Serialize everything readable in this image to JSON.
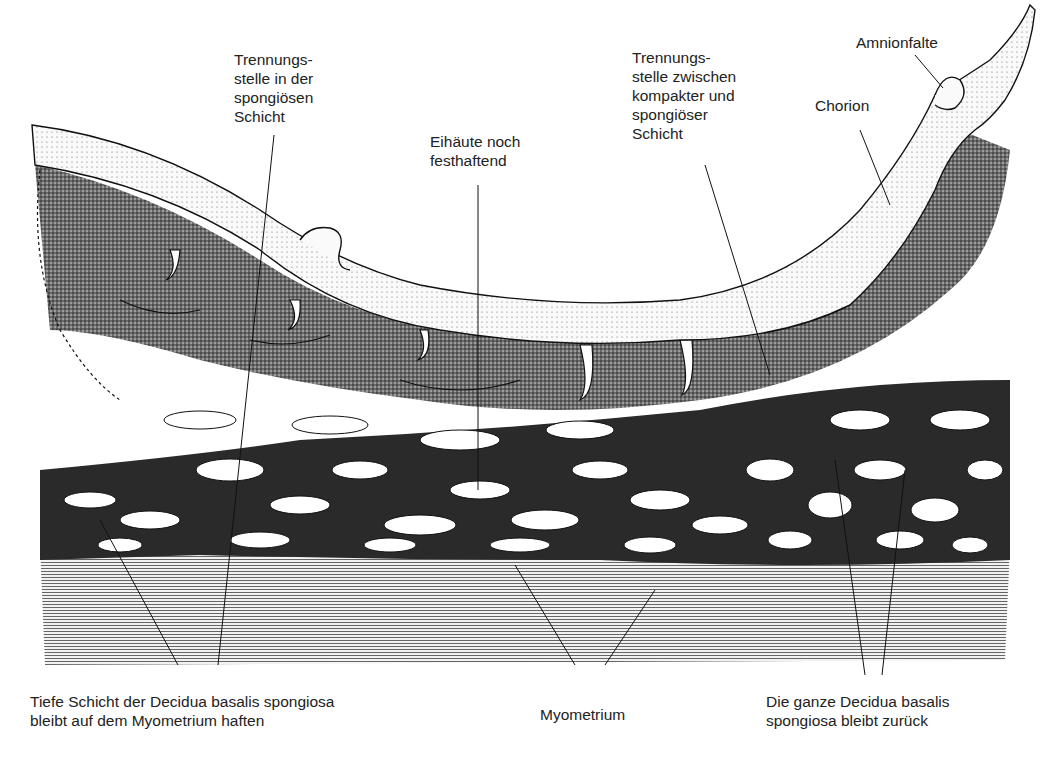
{
  "figure": {
    "labels": {
      "trennung_spongiosa": [
        "Trennungs-",
        "stelle in der",
        "spongiösen",
        "Schicht"
      ],
      "eihaeute": [
        "Eihäute noch",
        "festhaftend"
      ],
      "trennung_zwischen": [
        "Trennungs-",
        "stelle zwischen",
        "kompakter und",
        "spongiöser",
        "Schicht"
      ],
      "amnionfalte": [
        "Amnionfalte"
      ],
      "chorion": [
        "Chorion"
      ],
      "tiefe_schicht": [
        "Tiefe Schicht der Decidua basalis spongiosa",
        "bleibt auf dem Myometrium haften"
      ],
      "myometrium": [
        "Myometrium"
      ],
      "ganze_decidua": [
        "Die ganze Decidua basalis",
        "spongiosa bleibt zurück"
      ]
    }
  }
}
